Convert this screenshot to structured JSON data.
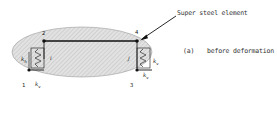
{
  "diagram": {
    "type": "structural-schematic",
    "caption": {
      "tag": "(a)",
      "text": "before deformation"
    },
    "callout": {
      "text": "Super steel element",
      "points_to": "node-4"
    },
    "nodes": [
      {
        "id": "1",
        "label": "1"
      },
      {
        "id": "2",
        "label": "2"
      },
      {
        "id": "3",
        "label": "3"
      },
      {
        "id": "4",
        "label": "4"
      }
    ],
    "inner_labels": {
      "left_element": "i",
      "right_element": "j"
    },
    "springs": {
      "horizontal": "k",
      "horizontal_sub": "h",
      "vertical": "k",
      "vertical_sub": "v"
    },
    "colors": {
      "ellipse_fill": "#d9d9d9",
      "hatch": "#b0b0b0",
      "line": "#111111"
    }
  }
}
